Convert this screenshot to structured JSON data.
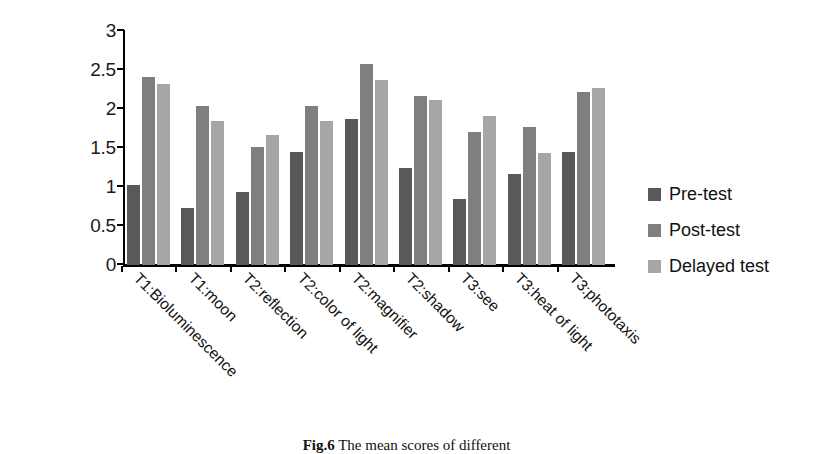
{
  "chart_data": {
    "type": "bar",
    "title": "",
    "xlabel": "",
    "ylabel": "",
    "ylim": [
      0,
      3
    ],
    "ytick_labels": [
      "3",
      "2.5",
      "2",
      "1.5",
      "1",
      "0.5",
      "0"
    ],
    "yticks": [
      3,
      2.5,
      2,
      1.5,
      1,
      0.5,
      0
    ],
    "grid": false,
    "legend_position": "right",
    "categories": [
      "T1:Bioluminescence",
      "T1:moon",
      "T2:reflection",
      "T2:color of light",
      "T2:magnifier",
      "T2:shadow",
      "T3:see",
      "T3:heat of light",
      "T3:phototaxis"
    ],
    "series": [
      {
        "name": "Pre-test",
        "color": "#595959",
        "values": [
          1.02,
          0.73,
          0.93,
          1.45,
          1.87,
          1.25,
          0.84,
          1.17,
          1.45
        ]
      },
      {
        "name": "Post-test",
        "color": "#7f7f7f",
        "values": [
          2.41,
          2.04,
          1.51,
          2.04,
          2.58,
          2.17,
          1.7,
          1.77,
          2.22
        ]
      },
      {
        "name": "Delayed test",
        "color": "#a6a6a6",
        "values": [
          2.32,
          1.85,
          1.67,
          1.85,
          2.37,
          2.11,
          1.91,
          1.43,
          2.27
        ]
      }
    ]
  },
  "legend": {
    "items": [
      {
        "label": "Pre-test",
        "color": "#595959"
      },
      {
        "label": "Post-test",
        "color": "#7f7f7f"
      },
      {
        "label": "Delayed test",
        "color": "#a6a6a6"
      }
    ]
  },
  "caption": {
    "figure_number": "Fig.6",
    "text": "The mean scores of different"
  }
}
